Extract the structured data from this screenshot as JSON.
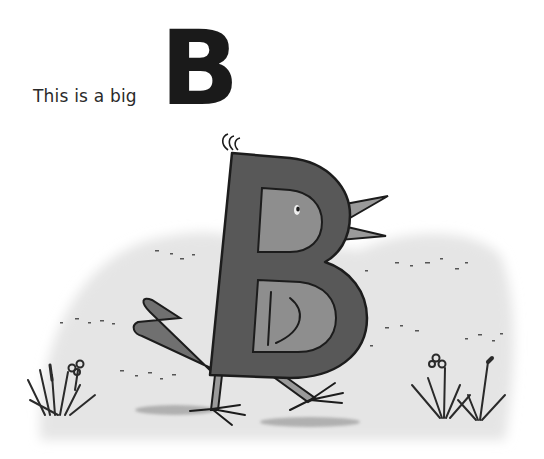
{
  "page": {
    "caption": "This is a big",
    "big_letter": "B"
  },
  "illustration": {
    "subject": "bird shaped like the letter B",
    "elements": [
      "bird-body",
      "beak",
      "eye",
      "wing",
      "tail",
      "legs",
      "feet",
      "grass-tufts",
      "flowers",
      "ground-wash"
    ],
    "colors": {
      "body": "#585858",
      "counter": "#8e8e8e",
      "outline": "#1c1c1c",
      "ground": "#e6e6e6",
      "beak": "#9a9a9a"
    }
  }
}
